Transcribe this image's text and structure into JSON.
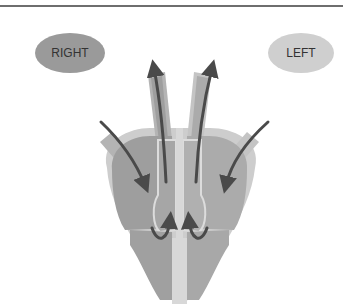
{
  "diagram": {
    "type": "heart blood flow schematic",
    "labels": {
      "right": "RIGHT",
      "left": "LEFT"
    },
    "colors": {
      "rule": "#6e6e6e",
      "right_label_fill": "#9a9a9a",
      "left_label_fill": "#cfcfcf",
      "outer_wall": "#cdcdcd",
      "chamber_dark": "#9e9e9e",
      "chamber_mid": "#ababab",
      "septum": "#d8d8d8",
      "arrow": "#4a4a4a"
    },
    "arrows": [
      {
        "name": "right-inflow",
        "direction": "into right atrium from upper left"
      },
      {
        "name": "left-inflow",
        "direction": "into left atrium from upper right"
      },
      {
        "name": "right-outflow",
        "direction": "up out of right side vessel"
      },
      {
        "name": "left-outflow",
        "direction": "up out of left side vessel"
      },
      {
        "name": "right-ventricle-loop",
        "direction": "curved upward in right ventricle"
      },
      {
        "name": "left-ventricle-loop",
        "direction": "curved upward in left ventricle"
      }
    ]
  }
}
